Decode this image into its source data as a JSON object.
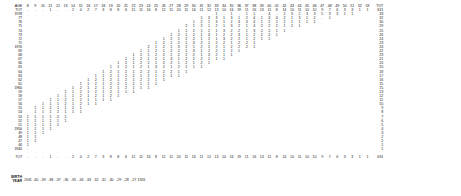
{
  "document": {
    "kind": "statistical-cohort-table",
    "corner_label": "AGE",
    "total_label": "TOT",
    "birth_year_label_line1": "BIRTH",
    "birth_year_label_line2": "YEAR"
  },
  "columns": {
    "ages": [
      "8",
      "9",
      "10",
      "11",
      "12",
      "13",
      "14",
      "15",
      "16",
      "17",
      "18",
      "19",
      "20",
      "21",
      "22",
      "23",
      "24",
      "25",
      "26",
      "27",
      "28",
      "29",
      "30",
      "31",
      "32",
      "33",
      "34",
      "35",
      "36",
      "37",
      "38",
      "39",
      "40",
      "41",
      "42",
      "43",
      "44",
      "45",
      "46",
      "47",
      "48",
      "49",
      "50",
      "51",
      "52",
      "53"
    ],
    "total_header": "TOT"
  },
  "column_totals": {
    "values": [
      "-",
      "-",
      "-",
      "1",
      "-",
      "-",
      "2",
      "4",
      "2",
      "7",
      "3",
      "8",
      "8",
      "6",
      "11",
      "11",
      "16",
      "8",
      "12",
      "11",
      "20",
      "11",
      "16",
      "11",
      "12",
      "13",
      "10",
      "16",
      "19",
      "11",
      "16",
      "13",
      "11",
      "8",
      "14",
      "10",
      "11",
      "10",
      "10",
      "9",
      "7",
      "6",
      "3",
      "3",
      "1",
      "1"
    ],
    "grand_total": "631"
  },
  "rows": [
    {
      "year": "1978",
      "decade": true,
      "total": "33",
      "cells": {
        "33": "1",
        "34": "-",
        "35": "1",
        "36": "-",
        "37": "1",
        "38": "1",
        "39": "-",
        "40": "4",
        "41": "-",
        "42": "2",
        "43": "3",
        "44": "2",
        "45": "3",
        "46": "3",
        "47": "5",
        "48": "3",
        "49": "3",
        "50": "1",
        "51": "1"
      }
    },
    {
      "year": "77",
      "decade": false,
      "total": "32",
      "cells": {
        "31": "1",
        "32": "3",
        "33": "3",
        "34": "1",
        "35": "3",
        "36": "1",
        "37": "2",
        "38": "4",
        "39": "1",
        "40": "3",
        "41": "4",
        "42": "2",
        "43": "1",
        "44": "3",
        "45": "1",
        "46": "2",
        "47": "-",
        "48": "1"
      }
    },
    {
      "year": "76",
      "decade": false,
      "total": "30",
      "cells": {
        "30": "1",
        "31": "2",
        "32": "1",
        "33": "3",
        "34": "1",
        "35": "2",
        "36": "3",
        "37": "3",
        "38": "4",
        "39": "1",
        "40": "2",
        "41": "2",
        "42": "2",
        "43": "1",
        "44": "1",
        "45": "1",
        "46": "1"
      }
    },
    {
      "year": "75",
      "decade": false,
      "total": "29",
      "cells": {
        "29": "2",
        "30": "1",
        "31": "2",
        "32": "1",
        "33": "2",
        "34": "1",
        "35": "3",
        "36": "2",
        "37": "1",
        "38": "4",
        "39": "2",
        "40": "2",
        "41": "2",
        "42": "1",
        "43": "2",
        "44": "1"
      }
    },
    {
      "year": "74",
      "decade": false,
      "total": "25",
      "cells": {
        "28": "1",
        "29": "1",
        "30": "2",
        "31": "1",
        "32": "2",
        "33": "1",
        "34": "3",
        "35": "2",
        "36": "2",
        "37": "1",
        "38": "3",
        "39": "2",
        "40": "2",
        "41": "1",
        "42": "1"
      }
    },
    {
      "year": "73",
      "decade": false,
      "total": "26",
      "cells": {
        "27": "1",
        "28": "2",
        "29": "1",
        "30": "2",
        "31": "1",
        "32": "3",
        "33": "1",
        "34": "2",
        "35": "2",
        "36": "3",
        "37": "1",
        "38": "2",
        "39": "2",
        "40": "2",
        "41": "1"
      }
    },
    {
      "year": "72",
      "decade": false,
      "total": "24",
      "cells": {
        "26": "1",
        "27": "2",
        "28": "1",
        "29": "2",
        "30": "2",
        "31": "1",
        "32": "2",
        "33": "1",
        "34": "3",
        "35": "2",
        "36": "2",
        "37": "1",
        "38": "2",
        "39": "1",
        "40": "1"
      }
    },
    {
      "year": "71",
      "decade": false,
      "total": "23",
      "cells": {
        "25": "1",
        "26": "2",
        "27": "1",
        "28": "2",
        "29": "1",
        "30": "3",
        "31": "2",
        "32": "1",
        "33": "2",
        "34": "2",
        "35": "1",
        "36": "2",
        "37": "2",
        "38": "1"
      }
    },
    {
      "year": "1970",
      "decade": true,
      "total": "24",
      "cells": {
        "24": "2",
        "25": "1",
        "26": "2",
        "27": "1",
        "28": "3",
        "29": "2",
        "30": "1",
        "31": "2",
        "32": "2",
        "33": "2",
        "34": "1",
        "35": "2",
        "36": "2",
        "37": "2",
        "38": "1"
      }
    },
    {
      "year": "69",
      "decade": false,
      "total": "22",
      "cells": {
        "23": "1",
        "24": "1",
        "25": "2",
        "26": "1",
        "27": "2",
        "28": "2",
        "29": "1",
        "30": "3",
        "31": "1",
        "32": "2",
        "33": "2",
        "34": "1",
        "35": "2",
        "36": "1"
      }
    },
    {
      "year": "68",
      "decade": false,
      "total": "23",
      "cells": {
        "22": "1",
        "23": "2",
        "24": "1",
        "25": "2",
        "26": "2",
        "27": "1",
        "28": "2",
        "29": "2",
        "30": "2",
        "31": "1",
        "32": "3",
        "33": "2",
        "34": "1",
        "35": "1"
      }
    },
    {
      "year": "67",
      "decade": false,
      "total": "21",
      "cells": {
        "21": "1",
        "22": "1",
        "23": "2",
        "24": "1",
        "25": "2",
        "26": "1",
        "27": "3",
        "28": "1",
        "29": "2",
        "30": "2",
        "31": "2",
        "32": "1",
        "33": "1",
        "34": "1"
      }
    },
    {
      "year": "66",
      "decade": false,
      "total": "20",
      "cells": {
        "20": "1",
        "21": "2",
        "22": "1",
        "23": "2",
        "24": "2",
        "25": "1",
        "26": "2",
        "27": "2",
        "28": "1",
        "29": "2",
        "30": "1",
        "31": "2",
        "32": "1"
      }
    },
    {
      "year": "65",
      "decade": false,
      "total": "20",
      "cells": {
        "19": "1",
        "20": "1",
        "21": "2",
        "22": "1",
        "23": "2",
        "24": "1",
        "25": "3",
        "26": "2",
        "27": "1",
        "28": "2",
        "29": "2",
        "30": "1",
        "31": "1"
      }
    },
    {
      "year": "64",
      "decade": false,
      "total": "18",
      "cells": {
        "18": "1",
        "19": "2",
        "20": "1",
        "21": "2",
        "22": "1",
        "23": "2",
        "24": "2",
        "25": "1",
        "26": "2",
        "27": "2",
        "28": "1",
        "29": "1"
      }
    },
    {
      "year": "63",
      "decade": false,
      "total": "17",
      "cells": {
        "17": "1",
        "18": "1",
        "19": "2",
        "20": "1",
        "21": "2",
        "22": "2",
        "23": "1",
        "24": "2",
        "25": "1",
        "26": "2",
        "27": "1",
        "28": "1"
      }
    },
    {
      "year": "62",
      "decade": false,
      "total": "16",
      "cells": {
        "16": "1",
        "17": "2",
        "18": "1",
        "19": "2",
        "20": "1",
        "21": "2",
        "22": "1",
        "23": "2",
        "24": "2",
        "25": "1",
        "26": "1"
      }
    },
    {
      "year": "61",
      "decade": false,
      "total": "15",
      "cells": {
        "15": "1",
        "16": "1",
        "17": "2",
        "18": "1",
        "19": "2",
        "20": "2",
        "21": "1",
        "22": "2",
        "23": "1",
        "24": "1",
        "25": "1"
      }
    },
    {
      "year": "1960",
      "decade": true,
      "total": "15",
      "cells": {
        "14": "1",
        "15": "2",
        "16": "1",
        "17": "2",
        "18": "1",
        "19": "2",
        "20": "1",
        "21": "2",
        "22": "1",
        "23": "1",
        "24": "1"
      }
    },
    {
      "year": "59",
      "decade": false,
      "total": "13",
      "cells": {
        "13": "1",
        "14": "1",
        "15": "2",
        "16": "1",
        "17": "2",
        "18": "1",
        "19": "2",
        "20": "1",
        "21": "1",
        "22": "1"
      }
    },
    {
      "year": "58",
      "decade": false,
      "total": "12",
      "cells": {
        "12": "1",
        "13": "1",
        "14": "1",
        "15": "2",
        "16": "1",
        "17": "2",
        "18": "1",
        "19": "2",
        "20": "1"
      }
    },
    {
      "year": "57",
      "decade": false,
      "total": "11",
      "cells": {
        "11": "1",
        "12": "1",
        "13": "2",
        "14": "1",
        "15": "2",
        "16": "1",
        "17": "1",
        "18": "1",
        "19": "1"
      }
    },
    {
      "year": "56",
      "decade": false,
      "total": "10",
      "cells": {
        "10": "1",
        "11": "1",
        "12": "1",
        "13": "2",
        "14": "1",
        "15": "2",
        "16": "1",
        "17": "1"
      }
    },
    {
      "year": "55",
      "decade": false,
      "total": "9",
      "cells": {
        "9": "1",
        "10": "1",
        "11": "2",
        "12": "1",
        "13": "1",
        "14": "2",
        "15": "1"
      }
    },
    {
      "year": "54",
      "decade": false,
      "total": "8",
      "cells": {
        "9": "1",
        "10": "1",
        "11": "1",
        "12": "2",
        "13": "1",
        "14": "1",
        "15": "1"
      }
    },
    {
      "year": "53",
      "decade": false,
      "total": "7",
      "cells": {
        "8": "1",
        "9": "1",
        "10": "1",
        "11": "1",
        "12": "2",
        "13": "1"
      }
    },
    {
      "year": "52",
      "decade": false,
      "total": "6",
      "cells": {
        "8": "1",
        "9": "1",
        "10": "1",
        "11": "1",
        "12": "1",
        "13": "1"
      }
    },
    {
      "year": "51",
      "decade": false,
      "total": "5",
      "cells": {
        "8": "1",
        "9": "1",
        "10": "1",
        "11": "1",
        "12": "1"
      }
    },
    {
      "year": "1950",
      "decade": true,
      "total": "4",
      "cells": {
        "8": "1",
        "9": "1",
        "10": "1",
        "11": "1"
      }
    },
    {
      "year": "49",
      "decade": false,
      "total": "3",
      "cells": {
        "8": "1",
        "9": "1",
        "10": "1"
      }
    },
    {
      "year": "48",
      "decade": false,
      "total": "2",
      "cells": {
        "8": "1",
        "9": "1"
      }
    },
    {
      "year": "47",
      "decade": false,
      "total": "2",
      "cells": {
        "8": "1",
        "9": "1"
      }
    },
    {
      "year": "46",
      "decade": false,
      "total": "1",
      "cells": {
        "8": "1"
      }
    },
    {
      "year": "1945",
      "decade": true,
      "total": "1",
      "cells": {
        "8": "-"
      }
    }
  ],
  "birth_years": [
    "1941",
    "-40",
    "-39",
    "-38",
    "-37",
    "-36",
    "-35",
    "-34",
    "-33",
    "-32",
    "-31",
    "-30",
    "-29",
    "-28",
    "-27",
    "1926"
  ]
}
